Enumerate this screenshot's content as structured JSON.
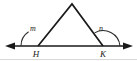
{
  "figure": {
    "kind": "geometry-diagram",
    "background_color": "#ffffff",
    "ink_color": "#1a1a1a",
    "labels": {
      "vertex_left": "H",
      "vertex_right": "K",
      "angle_left": "m",
      "angle_right": "n"
    },
    "geometry": {
      "baseline": {
        "x1": 8,
        "y1": 46,
        "x2": 130,
        "y2": 46
      },
      "apex": {
        "x": 72,
        "y": 4
      },
      "vertex_left_point": {
        "x": 38,
        "y": 46
      },
      "vertex_right_point": {
        "x": 103,
        "y": 46
      },
      "arrow_left_tip": {
        "x": 5,
        "y": 46
      },
      "arrow_right_tip": {
        "x": 133,
        "y": 46
      },
      "arc_left_radius": 17,
      "arc_right_radius": 17
    },
    "label_positions": {
      "vertex_left": {
        "x": 36,
        "y": 57
      },
      "vertex_right": {
        "x": 101,
        "y": 57
      },
      "angle_left": {
        "x": 30,
        "y": 31
      },
      "angle_right": {
        "x": 98,
        "y": 31
      }
    }
  }
}
